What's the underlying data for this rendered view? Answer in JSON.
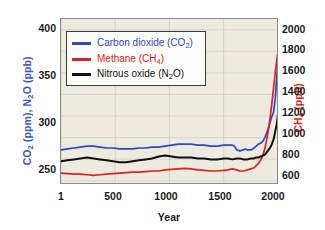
{
  "chart_data": {
    "type": "line",
    "title": "",
    "xlabel": "Year",
    "ylabel_left": "CO2 (ppm), N2O (ppb)",
    "ylabel_right": "CH4 (ppb)",
    "xlim": [
      0,
      2010
    ],
    "ylim_left": [
      240,
      415
    ],
    "ylim_right": [
      560,
      2100
    ],
    "xticks": [
      1,
      500,
      1000,
      1500,
      2000
    ],
    "xtick_labels": [
      "1",
      "500",
      "1000",
      "1500",
      "2000"
    ],
    "yticks_left": [
      250,
      300,
      350,
      400
    ],
    "ytick_labels_left": [
      "250",
      "300",
      "350",
      "400"
    ],
    "yticks_right": [
      600,
      800,
      1000,
      1200,
      1400,
      1600,
      1800,
      2000
    ],
    "ytick_labels_right": [
      "600",
      "800",
      "1000",
      "1200",
      "1400",
      "1600",
      "1800",
      "2000"
    ],
    "grid": true,
    "legend_position": "upper-left",
    "legend": [
      {
        "label": "Carbon dioxide (CO2)",
        "color": "#2b49c6"
      },
      {
        "label": "Methane (CH4)",
        "color": "#e02020"
      },
      {
        "label": "Nitrous oxide (N2O)",
        "color": "#111111"
      }
    ],
    "series": [
      {
        "name": "Carbon dioxide (CO2)",
        "axis": "left",
        "color": "#2b49c6",
        "unit": "ppm",
        "x": [
          1,
          60,
          120,
          180,
          240,
          300,
          360,
          420,
          480,
          540,
          600,
          660,
          720,
          780,
          840,
          900,
          960,
          1020,
          1080,
          1140,
          1200,
          1260,
          1320,
          1380,
          1440,
          1500,
          1540,
          1580,
          1600,
          1620,
          1650,
          1680,
          1700,
          1720,
          1750,
          1780,
          1800,
          1820,
          1840,
          1860,
          1880,
          1900,
          1920,
          1940,
          1960,
          1975,
          1990,
          2000,
          2005,
          2010
        ],
        "y": [
          277,
          278,
          279,
          280,
          281,
          281,
          280,
          279,
          279,
          278,
          278,
          278,
          279,
          279,
          280,
          280,
          281,
          282,
          283,
          283,
          283,
          282,
          282,
          281,
          281,
          282,
          282,
          282,
          281,
          277,
          276,
          277,
          278,
          277,
          277,
          279,
          281,
          283,
          284,
          286,
          290,
          296,
          303,
          311,
          317,
          331,
          354,
          369,
          380,
          408
        ]
      },
      {
        "name": "Methane (CH4)",
        "axis": "right",
        "color": "#e02020",
        "unit": "ppb",
        "x": [
          1,
          60,
          120,
          180,
          240,
          300,
          360,
          420,
          480,
          540,
          600,
          660,
          720,
          780,
          840,
          900,
          960,
          1020,
          1080,
          1140,
          1200,
          1260,
          1320,
          1380,
          1440,
          1500,
          1540,
          1580,
          1620,
          1650,
          1680,
          1700,
          1720,
          1750,
          1780,
          1800,
          1820,
          1840,
          1860,
          1880,
          1900,
          1920,
          1940,
          1960,
          1975,
          1990,
          2000,
          2005,
          2010
        ],
        "y": [
          670,
          665,
          660,
          660,
          655,
          650,
          655,
          660,
          665,
          670,
          675,
          680,
          680,
          685,
          690,
          690,
          700,
          705,
          710,
          715,
          710,
          700,
          695,
          690,
          690,
          695,
          700,
          710,
          700,
          690,
          690,
          695,
          700,
          710,
          720,
          740,
          760,
          790,
          830,
          900,
          1000,
          1120,
          1280,
          1460,
          1600,
          1720,
          1790,
          1840,
          1900
        ]
      },
      {
        "name": "Nitrous oxide (N2O)",
        "axis": "left",
        "color": "#111111",
        "unit": "ppb",
        "x": [
          1,
          60,
          120,
          180,
          240,
          300,
          360,
          420,
          480,
          540,
          600,
          660,
          720,
          780,
          840,
          900,
          960,
          1020,
          1080,
          1140,
          1200,
          1260,
          1320,
          1380,
          1440,
          1500,
          1540,
          1580,
          1620,
          1650,
          1680,
          1700,
          1720,
          1750,
          1780,
          1800,
          1820,
          1840,
          1860,
          1880,
          1900,
          1920,
          1940,
          1960,
          1975,
          1990,
          2000,
          2005,
          2010
        ],
        "y": [
          265,
          266,
          267,
          268,
          269,
          268,
          267,
          266,
          265,
          264,
          264,
          265,
          266,
          267,
          268,
          270,
          271,
          270,
          269,
          269,
          269,
          268,
          268,
          267,
          267,
          268,
          268,
          267,
          268,
          268,
          267,
          267,
          267,
          268,
          268,
          269,
          269,
          270,
          271,
          272,
          275,
          278,
          282,
          288,
          296,
          305,
          314,
          322,
          330
        ]
      }
    ]
  },
  "colors": {
    "co2": "#2b49c6",
    "ch4": "#e02020",
    "n2o": "#111111",
    "plot_background": "#edeae0",
    "frame": "#8c8c8c",
    "grid_horizontal": "#d9cfc0",
    "grid_vertical": "#cfcabb"
  }
}
